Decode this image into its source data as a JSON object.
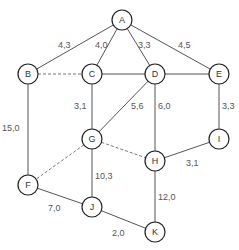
{
  "diagram": {
    "type": "weighted-graph",
    "nodes": [
      {
        "id": "A",
        "x": 122,
        "y": 20
      },
      {
        "id": "B",
        "x": 28,
        "y": 74
      },
      {
        "id": "C",
        "x": 92,
        "y": 74
      },
      {
        "id": "D",
        "x": 155,
        "y": 74
      },
      {
        "id": "E",
        "x": 219,
        "y": 74
      },
      {
        "id": "G",
        "x": 92,
        "y": 139
      },
      {
        "id": "H",
        "x": 155,
        "y": 161
      },
      {
        "id": "I",
        "x": 219,
        "y": 139
      },
      {
        "id": "F",
        "x": 28,
        "y": 185
      },
      {
        "id": "J",
        "x": 92,
        "y": 207
      },
      {
        "id": "K",
        "x": 155,
        "y": 232
      }
    ],
    "edges": [
      {
        "from": "A",
        "to": "B",
        "weight": "4,3",
        "style": "solid",
        "lx": 58,
        "ly": 48
      },
      {
        "from": "A",
        "to": "C",
        "weight": "4,0",
        "style": "solid",
        "lx": 95,
        "ly": 48
      },
      {
        "from": "A",
        "to": "D",
        "weight": "3,3",
        "style": "solid",
        "lx": 138,
        "ly": 48
      },
      {
        "from": "A",
        "to": "E",
        "weight": "4,5",
        "style": "solid",
        "lx": 178,
        "ly": 48
      },
      {
        "from": "B",
        "to": "C",
        "weight": "",
        "style": "dashed"
      },
      {
        "from": "C",
        "to": "D",
        "weight": "",
        "style": "solid"
      },
      {
        "from": "D",
        "to": "E",
        "weight": "",
        "style": "solid"
      },
      {
        "from": "C",
        "to": "G",
        "weight": "3,1",
        "style": "solid",
        "lx": 74,
        "ly": 109
      },
      {
        "from": "D",
        "to": "G",
        "weight": "5,6",
        "style": "solid",
        "lx": 131,
        "ly": 109
      },
      {
        "from": "D",
        "to": "H",
        "weight": "6,0",
        "style": "solid",
        "lx": 158,
        "ly": 109
      },
      {
        "from": "E",
        "to": "I",
        "weight": "3,3",
        "style": "solid",
        "lx": 222,
        "ly": 109
      },
      {
        "from": "B",
        "to": "F",
        "weight": "15,0",
        "style": "solid",
        "lx": 2,
        "ly": 131
      },
      {
        "from": "G",
        "to": "F",
        "weight": "",
        "style": "dashed"
      },
      {
        "from": "G",
        "to": "H",
        "weight": "",
        "style": "dashed"
      },
      {
        "from": "G",
        "to": "J",
        "weight": "10,3",
        "style": "solid",
        "lx": 95,
        "ly": 179
      },
      {
        "from": "I",
        "to": "H",
        "weight": "3,1",
        "style": "solid",
        "lx": 186,
        "ly": 166
      },
      {
        "from": "F",
        "to": "J",
        "weight": "7,0",
        "style": "solid",
        "lx": 48,
        "ly": 211
      },
      {
        "from": "H",
        "to": "K",
        "weight": "12,0",
        "style": "solid",
        "lx": 158,
        "ly": 200
      },
      {
        "from": "J",
        "to": "K",
        "weight": "2,0",
        "style": "solid",
        "lx": 112,
        "ly": 236
      }
    ]
  }
}
